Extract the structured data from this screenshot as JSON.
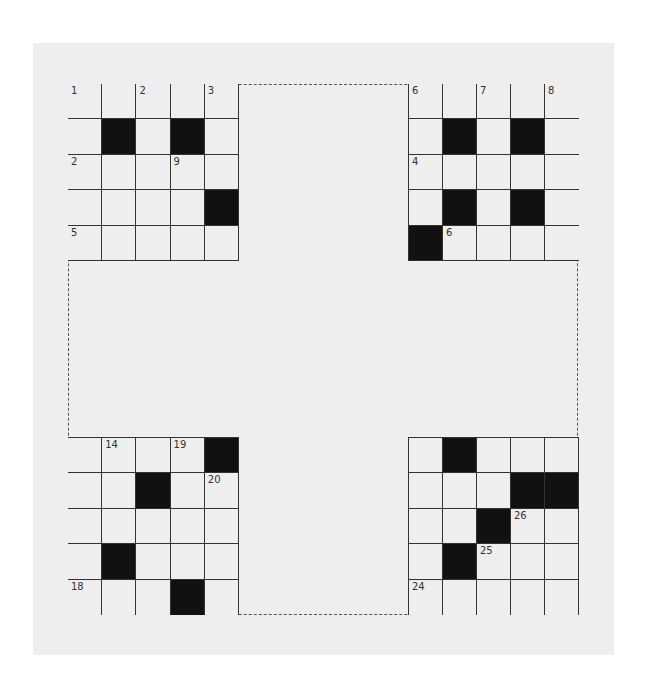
{
  "puzzle": {
    "grids": [
      {
        "id": "top-left",
        "cells": [
          [
            "1",
            "",
            "2",
            "",
            "3"
          ],
          [
            "",
            "#",
            "",
            "#",
            ""
          ],
          [
            "2",
            "",
            "",
            "9",
            ""
          ],
          [
            "",
            "",
            "",
            "",
            "#"
          ],
          [
            "5",
            "",
            "",
            "",
            ""
          ]
        ]
      },
      {
        "id": "top-right",
        "cells": [
          [
            "6",
            "",
            "7",
            "",
            "8"
          ],
          [
            "",
            "#",
            "",
            "#",
            ""
          ],
          [
            "4",
            "",
            "",
            "",
            ""
          ],
          [
            "",
            "#",
            "",
            "#",
            ""
          ],
          [
            "#",
            "6",
            "",
            "",
            ""
          ]
        ]
      },
      {
        "id": "bottom-left",
        "cells": [
          [
            "",
            "14",
            "",
            "19",
            "#"
          ],
          [
            "",
            "",
            "#",
            "",
            "20"
          ],
          [
            "",
            "",
            "",
            "",
            ""
          ],
          [
            "",
            "#",
            "",
            "",
            ""
          ],
          [
            "18",
            "",
            "",
            "#",
            ""
          ]
        ]
      },
      {
        "id": "bottom-right",
        "cells": [
          [
            "",
            "#",
            "",
            "",
            ""
          ],
          [
            "",
            "",
            "",
            "#",
            "#"
          ],
          [
            "",
            "",
            "#",
            "26",
            ""
          ],
          [
            "",
            "#",
            "25",
            "",
            ""
          ],
          [
            "24",
            "",
            "",
            "",
            ""
          ]
        ]
      }
    ]
  },
  "colors": {
    "paper": "#eeeeee",
    "block": "#111111",
    "line": "#333333"
  }
}
